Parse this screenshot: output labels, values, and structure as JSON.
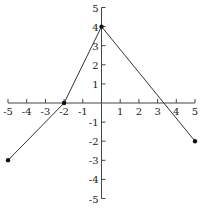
{
  "chart_data": {
    "type": "line",
    "title": "",
    "xlabel": "",
    "ylabel": "",
    "xlim": [
      -5,
      5
    ],
    "ylim": [
      -5,
      5
    ],
    "grid": false,
    "x_ticks": [
      -5,
      -4,
      -3,
      -2,
      -1,
      1,
      2,
      3,
      4,
      5
    ],
    "y_ticks": [
      5,
      4,
      3,
      2,
      1,
      -1,
      -2,
      -3,
      -4,
      -5
    ],
    "series": [
      {
        "name": "piecewise-linear",
        "points": [
          [
            -5,
            -3
          ],
          [
            -2,
            0
          ],
          [
            0,
            4
          ],
          [
            5,
            -2
          ]
        ],
        "endpoints_marked": [
          [
            -5,
            -3
          ],
          [
            -2,
            0
          ],
          [
            0,
            4
          ],
          [
            5,
            -2
          ]
        ]
      }
    ]
  },
  "colors": {
    "line": "#333333",
    "axis": "#444444",
    "point": "#111111"
  }
}
